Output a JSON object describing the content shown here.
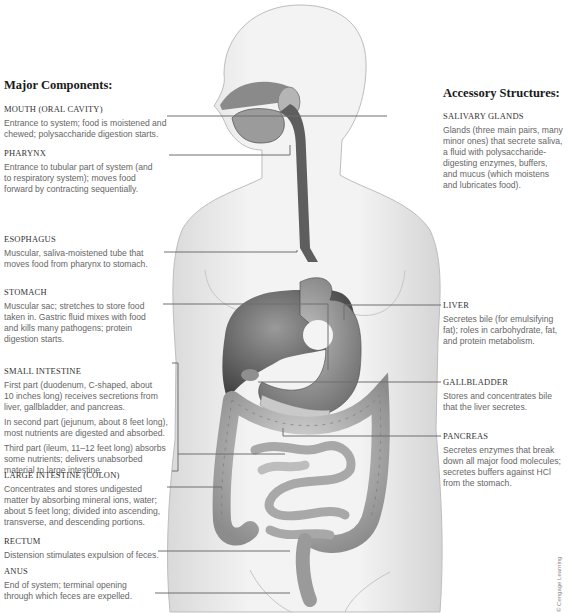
{
  "left_panel": {
    "title": "Major Components:",
    "items": [
      {
        "name": "MOUTH (ORAL CAVITY)",
        "desc": [
          "Entrance to system; food is moistened and",
          "chewed; polysaccharide digestion starts."
        ]
      },
      {
        "name": "PHARYNX",
        "desc": [
          "Entrance to tubular part of system (and",
          "to respiratory system); moves food",
          "forward by contracting sequentially."
        ]
      },
      {
        "name": "ESOPHAGUS",
        "desc": [
          "Muscular, saliva-moistened tube that",
          "moves food from pharynx to stomach."
        ]
      },
      {
        "name": "STOMACH",
        "desc": [
          "Muscular sac; stretches to store food",
          "taken in. Gastric fluid mixes with food",
          "and kills many pathogens; protein",
          "digestion starts."
        ]
      },
      {
        "name": "SMALL INTESTINE",
        "paragraphs": [
          [
            "First part (duodenum, C-shaped, about",
            "10 inches long) receives secretions from",
            "liver, gallbladder, and pancreas."
          ],
          [
            "In second part (jejunum, about 8 feet long),",
            "most nutrients are digested and absorbed."
          ],
          [
            "Third part (ileum, 11–12 feet long) absorbs",
            "some nutrients; delivers unabsorbed",
            "material to large intestine."
          ]
        ]
      },
      {
        "name": "LARGE INTESTINE (COLON)",
        "desc": [
          "Concentrates and stores undigested",
          "matter by absorbing mineral ions, water;",
          "about 5 feet long; divided into ascending,",
          "transverse, and descending portions."
        ]
      },
      {
        "name": "RECTUM",
        "desc": [
          "Distension stimulates expulsion of feces."
        ]
      },
      {
        "name": "ANUS",
        "desc": [
          "End of system; terminal opening",
          "through which feces are expelled."
        ]
      }
    ]
  },
  "right_panel": {
    "title": "Accessory Structures:",
    "items": [
      {
        "name": "SALIVARY GLANDS",
        "desc": [
          "Glands (three main pairs, many",
          "minor ones) that secrete saliva,",
          "a fluid with polysaccharide-",
          "digesting enzymes, buffers,",
          "and mucus (which moistens",
          "and lubricates food)."
        ]
      },
      {
        "name": "LIVER",
        "desc": [
          "Secretes bile (for emulsifying",
          "fat); roles in carbohydrate, fat,",
          "and protein metabolism."
        ]
      },
      {
        "name": "GALLBLADDER",
        "desc": [
          "Stores and concentrates bile",
          "that the liver secretes."
        ]
      },
      {
        "name": "PANCREAS",
        "desc": [
          "Secretes enzymes that break",
          "down all major food molecules;",
          "secretes buffers against HCl",
          "from the stomach."
        ]
      }
    ]
  },
  "credit": "© Cengage Learning",
  "colors": {
    "leader_line": "#6e6e6e",
    "organ_dark": "#5a5a5a",
    "body_fill": "#ececec"
  }
}
